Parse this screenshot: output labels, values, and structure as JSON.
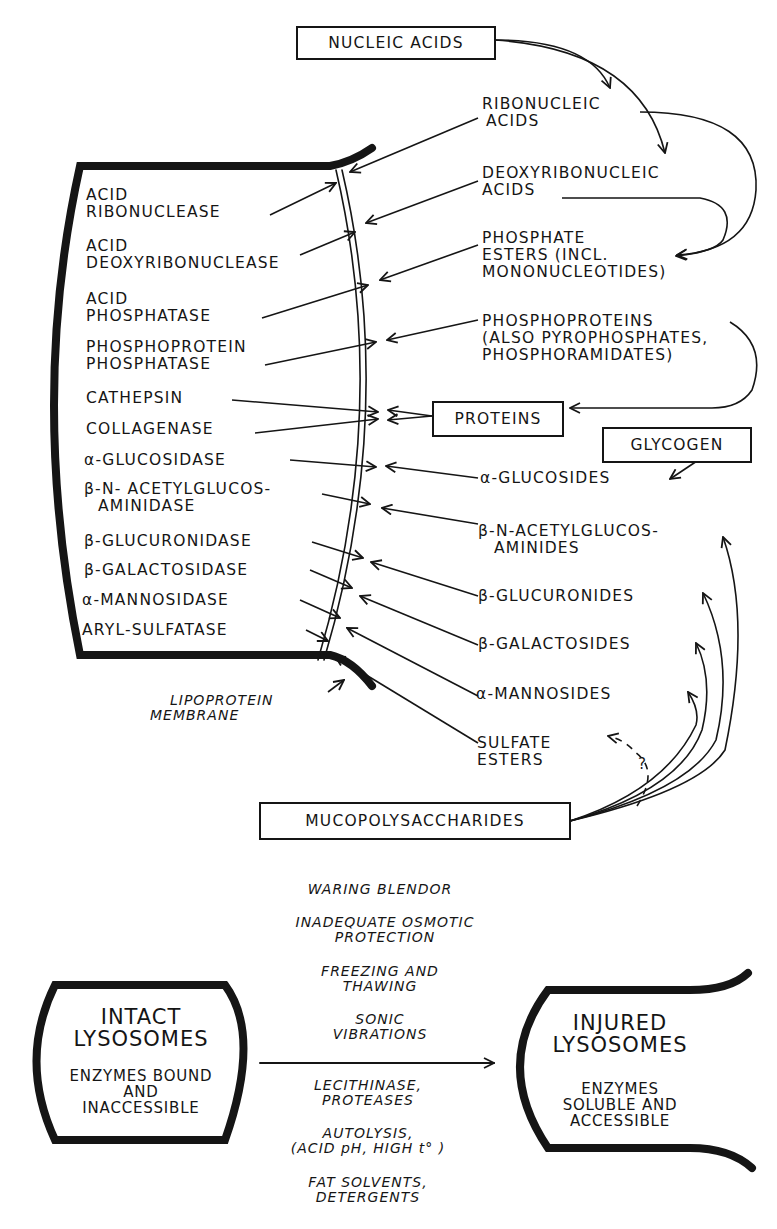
{
  "diagram": {
    "colors": {
      "ink": "#151515",
      "background": "#ffffff"
    },
    "substrate_sources": {
      "nucleic_acids": "NUCLEIC ACIDS",
      "proteins": "PROTEINS",
      "glycogen": "GLYCOGEN",
      "mucopolysaccharides": "MUCOPOLYSACCHARIDES"
    },
    "enzymes": [
      {
        "line1": "ACID",
        "line2": "RIBONUCLEASE"
      },
      {
        "line1": "ACID",
        "line2": "DEOXYRIBONUCLEASE"
      },
      {
        "line1": "ACID",
        "line2": "PHOSPHATASE"
      },
      {
        "line1": "PHOSPHOPROTEIN",
        "line2": "PHOSPHATASE"
      },
      {
        "line1": "CATHEPSIN"
      },
      {
        "line1": "COLLAGENASE"
      },
      {
        "line1": "α-GLUCOSIDASE"
      },
      {
        "line1": "β-N- ACETYLGLUCOS-",
        "line2": "AMINIDASE"
      },
      {
        "line1": "β-GLUCURONIDASE"
      },
      {
        "line1": "β-GALACTOSIDASE"
      },
      {
        "line1": "α-MANNOSIDASE"
      },
      {
        "line1": "ARYL-SULFATASE"
      }
    ],
    "substrates": [
      {
        "line1": "RIBONUCLEIC",
        "line2": "ACIDS"
      },
      {
        "line1": "DEOXYRIBONUCLEIC",
        "line2": "ACIDS"
      },
      {
        "line1": "PHOSPHATE",
        "line2": "ESTERS (INCL.",
        "line3": "MONONUCLEOTIDES)"
      },
      {
        "line1": "PHOSPHOPROTEINS",
        "line2": "(ALSO PYROPHOSPHATES,",
        "line3": "PHOSPHORAMIDATES)"
      },
      {
        "line1": "α-GLUCOSIDES"
      },
      {
        "line1": "β-N-ACETYLGLUCOS-",
        "line2": "AMINIDES"
      },
      {
        "line1": "β-GLUCURONIDES"
      },
      {
        "line1": "β-GALACTOSIDES"
      },
      {
        "line1": "α-MANNOSIDES"
      },
      {
        "line1": "SULFATE",
        "line2": "ESTERS"
      }
    ],
    "membrane_label": {
      "line1": "LIPOPROTEIN",
      "line2": "MEMBRANE"
    },
    "uncertain_mark": "?"
  },
  "transition": {
    "intact": {
      "title1": "INTACT",
      "title2": "LYSOSOMES",
      "desc1": "ENZYMES BOUND",
      "desc2": "AND",
      "desc3": "INACCESSIBLE"
    },
    "injured": {
      "title1": "INJURED",
      "title2": "LYSOSOMES",
      "desc1": "ENZYMES",
      "desc2": "SOLUBLE AND",
      "desc3": "ACCESSIBLE"
    },
    "causes_above": [
      {
        "line1": "WARING BLENDOR"
      },
      {
        "line1": "INADEQUATE OSMOTIC",
        "line2": "PROTECTION"
      },
      {
        "line1": "FREEZING AND",
        "line2": "THAWING"
      },
      {
        "line1": "SONIC",
        "line2": "VIBRATIONS"
      }
    ],
    "causes_below": [
      {
        "line1": "LECITHINASE,",
        "line2": "PROTEASES"
      },
      {
        "line1": "AUTOLYSIS,",
        "line2": "(ACID pH, HIGH t° )"
      },
      {
        "line1": "FAT SOLVENTS,",
        "line2": "DETERGENTS"
      }
    ]
  }
}
